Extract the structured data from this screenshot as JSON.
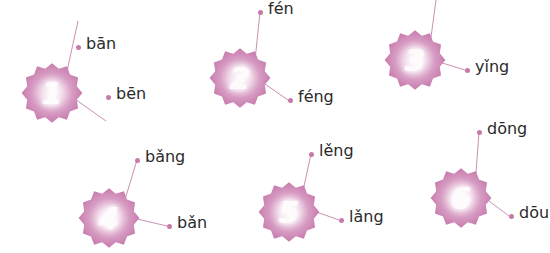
{
  "page": {
    "background_color": "#ffffff",
    "accent_color": "#cc8fb4",
    "badge_color": "#d08ab8",
    "text_color": "#2b2b2b"
  },
  "groups": [
    {
      "number": "1",
      "badge_name": "badge-1",
      "labels": [
        {
          "text": "bān",
          "name": "label-ban"
        },
        {
          "text": "bēn",
          "name": "label-ben"
        }
      ]
    },
    {
      "number": "2",
      "badge_name": "badge-2",
      "labels": [
        {
          "text": "fén",
          "name": "label-fen"
        },
        {
          "text": "féng",
          "name": "label-feng"
        }
      ]
    },
    {
      "number": "3",
      "badge_name": "badge-3",
      "labels": [
        {
          "text": "yǐn",
          "name": "label-yin"
        },
        {
          "text": "yǐng",
          "name": "label-ying"
        }
      ]
    },
    {
      "number": "4",
      "badge_name": "badge-4",
      "labels": [
        {
          "text": "bǎng",
          "name": "label-bang"
        },
        {
          "text": "bǎn",
          "name": "label-ban-3rd"
        }
      ]
    },
    {
      "number": "5",
      "badge_name": "badge-5",
      "labels": [
        {
          "text": "lěng",
          "name": "label-leng"
        },
        {
          "text": "lǎng",
          "name": "label-lang"
        }
      ]
    },
    {
      "number": "6",
      "badge_name": "badge-6",
      "labels": [
        {
          "text": "dōng",
          "name": "label-dong"
        },
        {
          "text": "dōu",
          "name": "label-dou"
        }
      ]
    }
  ]
}
